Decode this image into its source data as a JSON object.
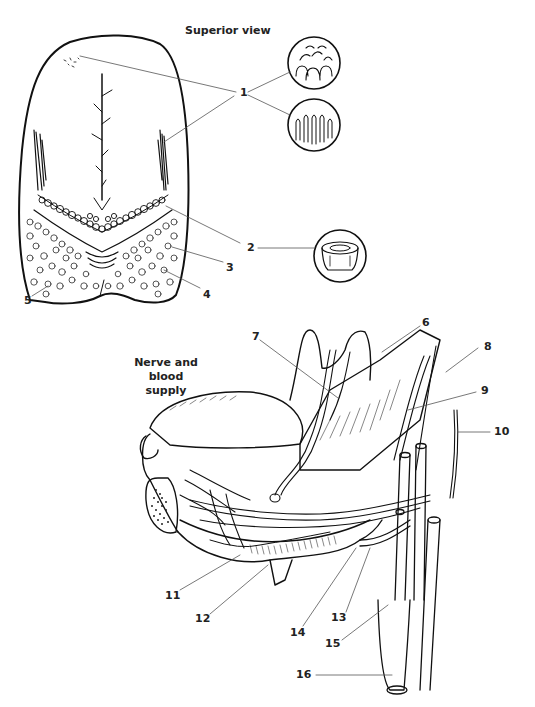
{
  "figure": {
    "sections": [
      {
        "id": "superior",
        "title": "Superior view"
      },
      {
        "id": "nerve",
        "title_line1": "Nerve and blood",
        "title_line2": "supply"
      }
    ],
    "labels": [
      {
        "num": "1",
        "x": 240,
        "y": 84
      },
      {
        "num": "2",
        "x": 248,
        "y": 244
      },
      {
        "num": "3",
        "x": 228,
        "y": 262
      },
      {
        "num": "4",
        "x": 204,
        "y": 288
      },
      {
        "num": "5",
        "x": 24,
        "y": 292
      },
      {
        "num": "6",
        "x": 424,
        "y": 320
      },
      {
        "num": "7",
        "x": 252,
        "y": 336
      },
      {
        "num": "8",
        "x": 484,
        "y": 343
      },
      {
        "num": "9",
        "x": 481,
        "y": 388
      },
      {
        "num": "10",
        "x": 495,
        "y": 430
      },
      {
        "num": "11",
        "x": 165,
        "y": 587
      },
      {
        "num": "12",
        "x": 195,
        "y": 613
      },
      {
        "num": "13",
        "x": 331,
        "y": 612
      },
      {
        "num": "14",
        "x": 290,
        "y": 627
      },
      {
        "num": "15",
        "x": 325,
        "y": 638
      },
      {
        "num": "16",
        "x": 296,
        "y": 671
      }
    ],
    "detail_circles": [
      {
        "name": "fungiform-papillae-detail",
        "cx": 314,
        "cy": 63,
        "r": 26
      },
      {
        "name": "filiform-papillae-detail",
        "cx": 314,
        "cy": 125,
        "r": 26
      },
      {
        "name": "vallate-papilla-detail",
        "cx": 340,
        "cy": 256,
        "r": 26
      }
    ]
  }
}
